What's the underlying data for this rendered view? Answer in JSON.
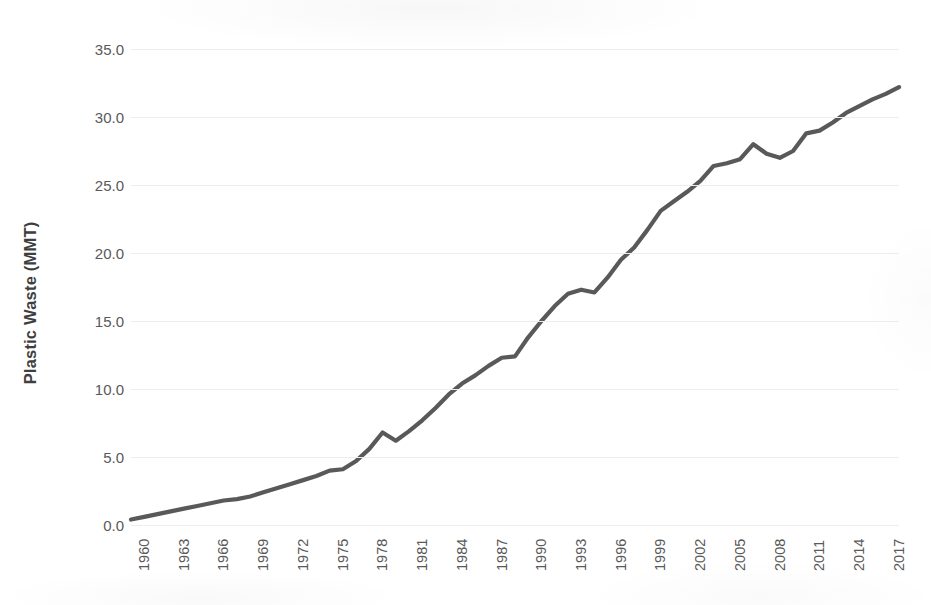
{
  "chart_data": {
    "type": "line",
    "title": "",
    "xlabel": "",
    "ylabel": "Plastic Waste (MMT)",
    "xlim": [
      1960,
      2018
    ],
    "ylim": [
      0.0,
      35.0
    ],
    "grid": true,
    "legend_position": "none",
    "line_color": "#595959",
    "gridline_color": "#ededed",
    "background_color": "#ffffff",
    "ytick_labels": [
      "0.0",
      "5.0",
      "10.0",
      "15.0",
      "20.0",
      "25.0",
      "30.0",
      "35.0"
    ],
    "ytick_values": [
      0,
      5,
      10,
      15,
      20,
      25,
      30,
      35
    ],
    "xtick_labels": [
      "1960",
      "1963",
      "1966",
      "1969",
      "1972",
      "1975",
      "1978",
      "1981",
      "1984",
      "1987",
      "1990",
      "1993",
      "1996",
      "1999",
      "2002",
      "2005",
      "2008",
      "2011",
      "2014",
      "2017"
    ],
    "xtick_values": [
      1960,
      1963,
      1966,
      1969,
      1972,
      1975,
      1978,
      1981,
      1984,
      1987,
      1990,
      1993,
      1996,
      1999,
      2002,
      2005,
      2008,
      2011,
      2014,
      2017
    ],
    "x": [
      1960,
      1961,
      1962,
      1963,
      1964,
      1965,
      1966,
      1967,
      1968,
      1969,
      1970,
      1971,
      1972,
      1973,
      1974,
      1975,
      1976,
      1977,
      1978,
      1979,
      1980,
      1981,
      1982,
      1983,
      1984,
      1985,
      1986,
      1987,
      1988,
      1989,
      1990,
      1991,
      1992,
      1993,
      1994,
      1995,
      1996,
      1997,
      1998,
      1999,
      2000,
      2001,
      2002,
      2003,
      2004,
      2005,
      2006,
      2007,
      2008,
      2009,
      2010,
      2011,
      2012,
      2013,
      2014,
      2015,
      2016,
      2017,
      2018
    ],
    "values": [
      0.4,
      0.6,
      0.8,
      1.0,
      1.2,
      1.4,
      1.6,
      1.8,
      1.9,
      2.1,
      2.4,
      2.7,
      3.0,
      3.3,
      3.6,
      4.0,
      4.1,
      4.7,
      5.6,
      6.8,
      6.2,
      6.9,
      7.7,
      8.6,
      9.6,
      10.4,
      11.0,
      11.7,
      12.3,
      12.4,
      13.8,
      15.0,
      16.1,
      17.0,
      17.3,
      17.1,
      18.2,
      19.5,
      20.4,
      21.7,
      23.1,
      23.8,
      24.5,
      25.3,
      26.4,
      26.6,
      26.9,
      28.0,
      27.3,
      27.0,
      27.5,
      28.8,
      29.0,
      29.6,
      30.3,
      30.8,
      31.3,
      31.7,
      32.2
    ]
  },
  "axis": {
    "y_title": "Plastic Waste (MMT)"
  }
}
